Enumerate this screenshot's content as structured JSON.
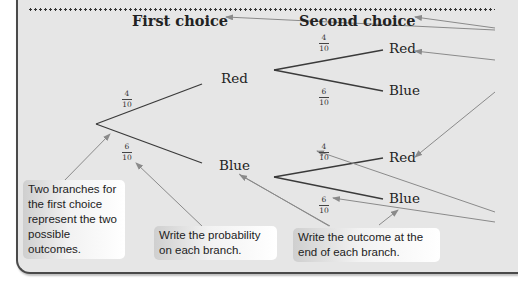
{
  "headings": {
    "first_choice": "First choice",
    "second_choice": "Second choice"
  },
  "first_stage": {
    "branches": [
      {
        "outcome": "Red",
        "probability": {
          "numerator": "4",
          "denominator": "10"
        }
      },
      {
        "outcome": "Blue",
        "probability": {
          "numerator": "6",
          "denominator": "10"
        }
      }
    ]
  },
  "second_stage": {
    "after_red": [
      {
        "outcome": "Red",
        "probability": {
          "numerator": "4",
          "denominator": "10"
        }
      },
      {
        "outcome": "Blue",
        "probability": {
          "numerator": "6",
          "denominator": "10"
        }
      }
    ],
    "after_blue": [
      {
        "outcome": "Red",
        "probability": {
          "numerator": "4",
          "denominator": "10"
        }
      },
      {
        "outcome": "Blue",
        "probability": {
          "numerator": "6",
          "denominator": "10"
        }
      }
    ]
  },
  "annotations": [
    {
      "text": "Two branches for the first choice represent the two possible outcomes."
    },
    {
      "text": "Write the probability on each branch."
    },
    {
      "text": "Write the outcome at the end of each branch."
    }
  ],
  "colors": {
    "background": "#e6e6e6",
    "branch_line": "#3a3a3a",
    "arrow": "#8a8a8a",
    "border": "#4a4a4a"
  }
}
